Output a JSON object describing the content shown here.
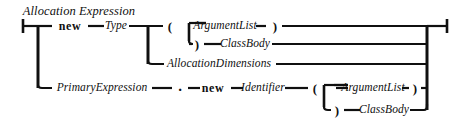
{
  "diagram": {
    "kind": "railroad-syntax-diagram",
    "title": "Allocation Expression",
    "stroke_color": "#101010",
    "background_color": "#ffffff",
    "line_width": 2.2,
    "rail_width": 3.0,
    "width": 462,
    "height": 133,
    "labels": {
      "title": "Allocation Expression",
      "new_1": "new",
      "type": "Type",
      "lparen_1": "(",
      "argument_list_1": "ArgumentList",
      "rparen_1": ")",
      "rparen_2": ")",
      "class_body_1": "ClassBody",
      "allocation_dimensions": "AllocationDimensions",
      "primary_expression": "PrimaryExpression",
      "dot": ".",
      "new_2": "new",
      "identifier": "Identifier",
      "lparen_2": "(",
      "argument_list_2": "ArgumentList",
      "rparen_3": ")",
      "rparen_4": ")",
      "class_body_2": "ClassBody"
    },
    "nodes": [
      {
        "id": "title",
        "text": "Allocation Expression",
        "x": 79,
        "y": 11,
        "style": "lbl-title"
      },
      {
        "id": "new-1",
        "text": "new",
        "x": 70,
        "y": 26,
        "style": "lbl-kw"
      },
      {
        "id": "type",
        "text": "Type",
        "x": 116,
        "y": 26,
        "style": "lbl-nonterm"
      },
      {
        "id": "lparen-1",
        "text": "(",
        "x": 170,
        "y": 26,
        "style": "lbl-punct"
      },
      {
        "id": "argument-list-1",
        "text": "ArgumentList",
        "x": 225,
        "y": 26,
        "style": "lbl-nonterm"
      },
      {
        "id": "rparen-1",
        "text": ")",
        "x": 275,
        "y": 26,
        "style": "lbl-punct"
      },
      {
        "id": "rparen-2",
        "text": ")",
        "x": 197,
        "y": 44,
        "style": "lbl-punct"
      },
      {
        "id": "class-body-1",
        "text": "ClassBody",
        "x": 245,
        "y": 44,
        "style": "lbl-nonterm"
      },
      {
        "id": "allocation-dimensions",
        "text": "AllocationDimensions",
        "x": 219,
        "y": 64,
        "style": "lbl-nonterm"
      },
      {
        "id": "primary-expression",
        "text": "PrimaryExpression",
        "x": 102,
        "y": 88,
        "style": "lbl-nonterm"
      },
      {
        "id": "dot",
        "text": ".",
        "x": 180,
        "y": 86,
        "style": "lbl-dot"
      },
      {
        "id": "new-2",
        "text": "new",
        "x": 213,
        "y": 88,
        "style": "lbl-kw"
      },
      {
        "id": "identifier",
        "text": "Identifier",
        "x": 263,
        "y": 88,
        "style": "lbl-nonterm"
      },
      {
        "id": "lparen-2",
        "text": "(",
        "x": 315,
        "y": 88,
        "style": "lbl-punct"
      },
      {
        "id": "argument-list-2",
        "text": "ArgumentList",
        "x": 373,
        "y": 88,
        "style": "lbl-nonterm"
      },
      {
        "id": "rparen-3",
        "text": ")",
        "x": 415,
        "y": 88,
        "style": "lbl-punct"
      },
      {
        "id": "rparen-4",
        "text": ")",
        "x": 337,
        "y": 110,
        "style": "lbl-punct"
      },
      {
        "id": "class-body-2",
        "text": "ClassBody",
        "x": 384,
        "y": 110,
        "style": "lbl-nonterm"
      }
    ]
  }
}
